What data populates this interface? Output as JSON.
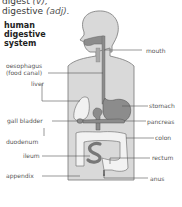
{
  "entries": {
    "verb": {
      "word": "digest",
      "pos": "(v),"
    },
    "adjective": {
      "word": "digestive",
      "pos": "(adj)."
    }
  },
  "heading": {
    "line1": "human",
    "line2": "digestive",
    "line3": "system"
  },
  "labels": {
    "left": {
      "oesophagus": "oesophagus",
      "food_canal": "(food canal)",
      "liver": "liver",
      "gall_bladder": "gall bladder",
      "duodenum": "duodenum",
      "ileum": "ileum",
      "appendix": "appendix"
    },
    "right": {
      "mouth": "mouth",
      "stomach": "stomach",
      "pancreas": "pancreas",
      "colon": "colon",
      "rectum": "rectum",
      "anus": "anus"
    }
  },
  "colors": {
    "body_fill": "#d9d9d9",
    "body_stroke": "#777777",
    "organ_dark": "#8c8c8c",
    "organ_light": "#f2f2f2",
    "leader_line": "#555555"
  }
}
